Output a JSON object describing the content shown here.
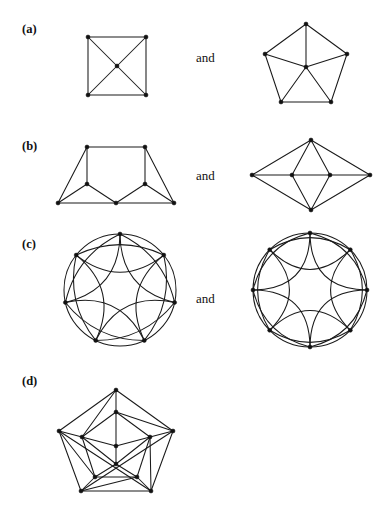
{
  "figure": {
    "kind": "graph-isomorphism-exercise",
    "background_color": "#ffffff",
    "ink_color": "#1a1a1a",
    "width": 390,
    "height": 520,
    "conjunction_label": "and",
    "parts": [
      {
        "id": "a",
        "label": "(a)",
        "label_x": 22,
        "label_y": 22,
        "conjunction_x": 196,
        "conjunction_y": 50,
        "graphs": [
          {
            "name": "square-with-diagonals",
            "x": 80,
            "y": 28,
            "w": 75,
            "h": 78,
            "vertex_count": 5,
            "edge_count": 8,
            "vertices": [
              {
                "id": "tl",
                "x": 8,
                "y": 9
              },
              {
                "id": "tr",
                "x": 66,
                "y": 9
              },
              {
                "id": "br",
                "x": 66,
                "y": 67
              },
              {
                "id": "bl",
                "x": 8,
                "y": 67
              },
              {
                "id": "c",
                "x": 37,
                "y": 38
              }
            ],
            "edges": [
              [
                "tl",
                "tr"
              ],
              [
                "tr",
                "br"
              ],
              [
                "br",
                "bl"
              ],
              [
                "bl",
                "tl"
              ],
              [
                "tl",
                "c"
              ],
              [
                "tr",
                "c"
              ],
              [
                "br",
                "c"
              ],
              [
                "bl",
                "c"
              ]
            ]
          },
          {
            "name": "pentagon-wheel",
            "x": 262,
            "y": 18,
            "w": 92,
            "h": 92,
            "vertex_count": 6,
            "edge_count": 10,
            "vertices": [
              {
                "id": "p0",
                "x": 44,
                "y": 6
              },
              {
                "id": "p1",
                "x": 85,
                "y": 36
              },
              {
                "id": "p2",
                "x": 69,
                "y": 84
              },
              {
                "id": "p3",
                "x": 19,
                "y": 84
              },
              {
                "id": "p4",
                "x": 3,
                "y": 36
              },
              {
                "id": "h",
                "x": 44,
                "y": 49
              }
            ],
            "edges": [
              [
                "p0",
                "p1"
              ],
              [
                "p1",
                "p2"
              ],
              [
                "p2",
                "p3"
              ],
              [
                "p3",
                "p4"
              ],
              [
                "p4",
                "p0"
              ],
              [
                "h",
                "p0"
              ],
              [
                "h",
                "p1"
              ],
              [
                "h",
                "p2"
              ],
              [
                "h",
                "p3"
              ],
              [
                "h",
                "p4"
              ]
            ]
          }
        ]
      },
      {
        "id": "b",
        "label": "(b)",
        "label_x": 22,
        "label_y": 139,
        "conjunction_x": 196,
        "conjunction_y": 168,
        "graphs": [
          {
            "name": "trapezoid-seven-vertex",
            "x": 52,
            "y": 140,
            "w": 126,
            "h": 68,
            "vertex_count": 7,
            "edge_count": 11,
            "vertices": [
              {
                "id": "tl",
                "x": 35,
                "y": 7
              },
              {
                "id": "tr",
                "x": 93,
                "y": 7
              },
              {
                "id": "ml",
                "x": 35,
                "y": 44
              },
              {
                "id": "mr",
                "x": 93,
                "y": 44
              },
              {
                "id": "bl",
                "x": 6,
                "y": 63
              },
              {
                "id": "bm",
                "x": 64,
                "y": 63
              },
              {
                "id": "br",
                "x": 122,
                "y": 63
              }
            ],
            "edges": [
              [
                "tl",
                "tr"
              ],
              [
                "tl",
                "ml"
              ],
              [
                "tr",
                "mr"
              ],
              [
                "tl",
                "bl"
              ],
              [
                "tr",
                "br"
              ],
              [
                "ml",
                "bl"
              ],
              [
                "ml",
                "bm"
              ],
              [
                "mr",
                "bm"
              ],
              [
                "mr",
                "br"
              ],
              [
                "bl",
                "bm"
              ],
              [
                "bm",
                "br"
              ]
            ]
          },
          {
            "name": "rhombus-with-inner-axis",
            "x": 248,
            "y": 136,
            "w": 126,
            "h": 78,
            "vertex_count": 6,
            "edge_count": 11,
            "vertices": [
              {
                "id": "t",
                "x": 63,
                "y": 4
              },
              {
                "id": "b",
                "x": 63,
                "y": 74
              },
              {
                "id": "l",
                "x": 4,
                "y": 39
              },
              {
                "id": "r",
                "x": 122,
                "y": 39
              },
              {
                "id": "il",
                "x": 44,
                "y": 39
              },
              {
                "id": "ir",
                "x": 82,
                "y": 39
              }
            ],
            "edges": [
              [
                "t",
                "l"
              ],
              [
                "t",
                "r"
              ],
              [
                "b",
                "l"
              ],
              [
                "b",
                "r"
              ],
              [
                "t",
                "il"
              ],
              [
                "t",
                "ir"
              ],
              [
                "b",
                "il"
              ],
              [
                "b",
                "ir"
              ],
              [
                "il",
                "ir"
              ],
              [
                "il",
                "l"
              ],
              [
                "ir",
                "r"
              ]
            ]
          }
        ]
      },
      {
        "id": "c",
        "label": "(c)",
        "label_x": 22,
        "label_y": 237,
        "conjunction_x": 196,
        "conjunction_y": 291,
        "graphs": [
          {
            "name": "circulant-arcs-seven",
            "x": 62,
            "y": 232,
            "w": 122,
            "h": 122,
            "cx": 58,
            "cy": 58,
            "r": 56,
            "vertex_count": 7,
            "start_angle_deg": -90,
            "chord_steps": [
              1,
              2
            ],
            "arc_bulge": 0.3
          },
          {
            "name": "circulant-arcs-eight",
            "x": 250,
            "y": 230,
            "w": 126,
            "h": 126,
            "cx": 60,
            "cy": 60,
            "r": 57,
            "vertex_count": 8,
            "start_angle_deg": -90,
            "chord_steps": [
              1,
              2
            ],
            "arc_bulge": 0.3
          }
        ]
      },
      {
        "id": "d",
        "label": "(d)",
        "label_x": 22,
        "label_y": 374,
        "conjunction_x": null,
        "conjunction_y": null,
        "graphs": [
          {
            "name": "icosahedron-graph",
            "x": 56,
            "y": 386,
            "w": 120,
            "h": 110,
            "vertex_count": 12,
            "edge_count": 30,
            "vertices": [
              {
                "id": "o0",
                "x": 60,
                "y": 4
              },
              {
                "id": "o1",
                "x": 117,
                "y": 45
              },
              {
                "id": "o2",
                "x": 95,
                "y": 105
              },
              {
                "id": "o3",
                "x": 25,
                "y": 105
              },
              {
                "id": "o4",
                "x": 3,
                "y": 45
              },
              {
                "id": "m0",
                "x": 60,
                "y": 26
              },
              {
                "id": "m1",
                "x": 94,
                "y": 51
              },
              {
                "id": "m2",
                "x": 81,
                "y": 91
              },
              {
                "id": "m3",
                "x": 39,
                "y": 91
              },
              {
                "id": "m4",
                "x": 26,
                "y": 51
              },
              {
                "id": "i0",
                "x": 60,
                "y": 60
              },
              {
                "id": "i1",
                "x": 60,
                "y": 78
              }
            ],
            "edges": [
              [
                "o0",
                "o1"
              ],
              [
                "o1",
                "o2"
              ],
              [
                "o2",
                "o3"
              ],
              [
                "o3",
                "o4"
              ],
              [
                "o4",
                "o0"
              ],
              [
                "m0",
                "m1"
              ],
              [
                "m1",
                "m2"
              ],
              [
                "m2",
                "m3"
              ],
              [
                "m3",
                "m4"
              ],
              [
                "m4",
                "m0"
              ],
              [
                "o0",
                "m0"
              ],
              [
                "o1",
                "m1"
              ],
              [
                "o2",
                "m2"
              ],
              [
                "o3",
                "m3"
              ],
              [
                "o4",
                "m4"
              ],
              [
                "o0",
                "m4"
              ],
              [
                "o1",
                "m0"
              ],
              [
                "o2",
                "m1"
              ],
              [
                "o3",
                "m2"
              ],
              [
                "o4",
                "m3"
              ],
              [
                "i0",
                "m0"
              ],
              [
                "i0",
                "m1"
              ],
              [
                "i0",
                "m4"
              ],
              [
                "i0",
                "i1"
              ],
              [
                "i1",
                "m2"
              ],
              [
                "i1",
                "m3"
              ],
              [
                "i1",
                "m1"
              ],
              [
                "i1",
                "m4"
              ],
              [
                "o2",
                "o4"
              ],
              [
                "o1",
                "o3"
              ]
            ]
          }
        ]
      }
    ]
  }
}
